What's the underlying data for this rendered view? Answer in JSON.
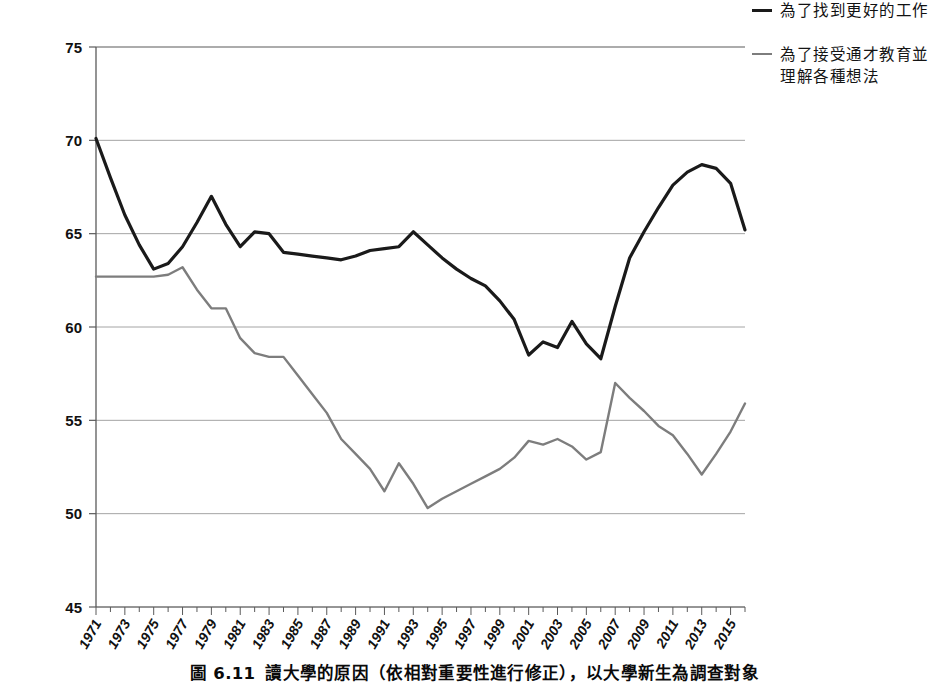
{
  "caption": {
    "number": "圖 6.11",
    "text": "讀大學的原因（依相對重要性進行修正），以大學新生為調查對象"
  },
  "legend": {
    "position": "right",
    "entries": [
      {
        "label": "為了找到更好的工作",
        "color": "#1a1a1a"
      },
      {
        "label": "為了接受通才教育並理解各種想法",
        "color": "#7d7d7d"
      }
    ]
  },
  "chart_data": {
    "type": "line",
    "title": "",
    "xlabel": "",
    "ylabel": "",
    "xlim": [
      1971,
      2016
    ],
    "ylim": [
      45,
      75
    ],
    "yticks": [
      45,
      50,
      55,
      60,
      65,
      70,
      75
    ],
    "grid": true,
    "grid_axis": "y",
    "xtick_labels": [
      "1971",
      "1973",
      "1975",
      "1977",
      "1979",
      "1981",
      "1983",
      "1985",
      "1987",
      "1989",
      "1991",
      "1993",
      "1995",
      "1997",
      "1999",
      "2001",
      "2003",
      "2005",
      "2007",
      "2009",
      "2011",
      "2013",
      "2015"
    ],
    "xtick_values": [
      1971,
      1973,
      1975,
      1977,
      1979,
      1981,
      1983,
      1985,
      1987,
      1989,
      1991,
      1993,
      1995,
      1997,
      1999,
      2001,
      2003,
      2005,
      2007,
      2009,
      2011,
      2013,
      2015
    ],
    "x": [
      1971,
      1972,
      1973,
      1974,
      1975,
      1976,
      1977,
      1978,
      1979,
      1980,
      1981,
      1982,
      1983,
      1984,
      1985,
      1986,
      1987,
      1988,
      1989,
      1990,
      1991,
      1992,
      1993,
      1994,
      1995,
      1996,
      1997,
      1998,
      1999,
      2000,
      2001,
      2002,
      2003,
      2004,
      2005,
      2006,
      2007,
      2008,
      2009,
      2010,
      2011,
      2012,
      2013,
      2014,
      2015,
      2016
    ],
    "series": [
      {
        "name": "為了找到更好的工作",
        "color": "#1a1a1a",
        "width": 3.2,
        "values": [
          70.1,
          68.0,
          66.0,
          64.4,
          63.1,
          63.4,
          64.3,
          65.6,
          67.0,
          65.5,
          64.3,
          65.1,
          65.0,
          64.0,
          63.9,
          63.8,
          63.7,
          63.6,
          63.8,
          64.1,
          64.2,
          64.3,
          65.1,
          64.4,
          63.7,
          63.1,
          62.6,
          62.2,
          61.4,
          60.4,
          58.5,
          59.2,
          58.9,
          60.3,
          59.1,
          58.3,
          61.1,
          63.7,
          65.1,
          66.4,
          67.6,
          68.3,
          68.7,
          68.5,
          67.7,
          65.2
        ]
      },
      {
        "name": "為了接受通才教育並理解各種想法",
        "color": "#7d7d7d",
        "width": 2.4,
        "values": [
          62.7,
          62.7,
          62.7,
          62.7,
          62.7,
          62.8,
          63.2,
          62.0,
          61.0,
          61.0,
          59.4,
          58.6,
          58.4,
          58.4,
          57.4,
          56.4,
          55.4,
          54.0,
          53.2,
          52.4,
          51.2,
          52.7,
          51.6,
          50.3,
          50.8,
          51.2,
          51.6,
          52.0,
          52.4,
          53.0,
          53.9,
          53.7,
          54.0,
          53.6,
          52.9,
          53.3,
          57.0,
          56.2,
          55.5,
          54.7,
          54.2,
          53.2,
          52.1,
          53.2,
          54.4,
          55.9
        ]
      }
    ]
  },
  "axes": {
    "ytick_labels": [
      "75",
      "70",
      "65",
      "60",
      "55",
      "50",
      "45"
    ]
  }
}
